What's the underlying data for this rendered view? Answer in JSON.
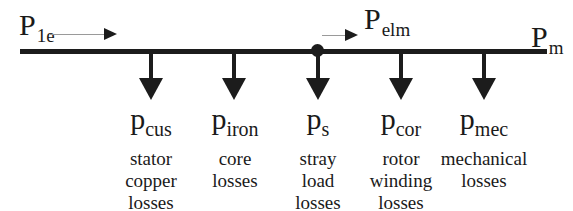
{
  "diagram": {
    "input": {
      "symbol": "P",
      "subscript": "1e"
    },
    "airgap": {
      "symbol": "P",
      "subscript": "elm"
    },
    "output": {
      "symbol": "P",
      "subscript": "m"
    },
    "losses": [
      {
        "symbol": "p",
        "subscript": "cus",
        "lines": [
          "stator",
          "copper",
          "losses"
        ]
      },
      {
        "symbol": "p",
        "subscript": "iron",
        "lines": [
          "core",
          "losses"
        ]
      },
      {
        "symbol": "p",
        "subscript": "s",
        "lines": [
          "stray",
          "load",
          "losses"
        ]
      },
      {
        "symbol": "p",
        "subscript": "cor",
        "lines": [
          "rotor",
          "winding",
          "losses"
        ]
      },
      {
        "symbol": "p",
        "subscript": "mec",
        "lines": [
          "mechanical",
          "losses"
        ]
      }
    ],
    "colors": {
      "line": "#1c1c1c",
      "text": "#1a1a1a",
      "flow_arrow_shaft": "#9a9a9a"
    }
  }
}
